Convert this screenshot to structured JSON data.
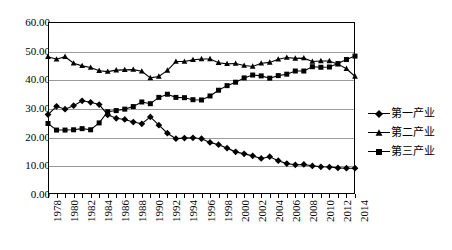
{
  "chart_data": {
    "type": "line",
    "title": "",
    "subtitle": "",
    "xlabel": "",
    "ylabel": "",
    "ylim": [
      0,
      60
    ],
    "ytick_step": 10,
    "ytick_labels": [
      "0.00",
      "10.00",
      "20.00",
      "30.00",
      "40.00",
      "50.00",
      "60.00"
    ],
    "grid": true,
    "legend_position": "right",
    "x": [
      1978,
      1979,
      1980,
      1981,
      1982,
      1983,
      1984,
      1985,
      1986,
      1987,
      1988,
      1989,
      1990,
      1991,
      1992,
      1993,
      1994,
      1995,
      1996,
      1997,
      1998,
      1999,
      2000,
      2001,
      2002,
      2003,
      2004,
      2005,
      2006,
      2007,
      2008,
      2009,
      2010,
      2011,
      2012,
      2013,
      2014
    ],
    "xtick_labels": [
      "1978",
      "1980",
      "1982",
      "1984",
      "1986",
      "1988",
      "1990",
      "1992",
      "1994",
      "1996",
      "1998",
      "2000",
      "2002",
      "2004",
      "2006",
      "2008",
      "2010",
      "2012",
      "2014"
    ],
    "series": [
      {
        "name": "第一产业",
        "marker": "diamond",
        "values": [
          27.7,
          30.6,
          29.6,
          30.8,
          32.5,
          32.0,
          31.2,
          27.6,
          26.4,
          26.0,
          25.1,
          24.5,
          26.9,
          24.0,
          21.2,
          19.3,
          19.5,
          19.6,
          19.3,
          18.0,
          17.2,
          16.0,
          14.7,
          14.0,
          13.3,
          12.4,
          13.0,
          11.6,
          10.6,
          10.2,
          10.3,
          9.8,
          9.5,
          9.4,
          9.1,
          9.0,
          9.0
        ]
      },
      {
        "name": "第二产业",
        "marker": "triangle",
        "values": [
          47.9,
          47.0,
          47.9,
          45.6,
          44.7,
          44.1,
          43.0,
          42.7,
          43.2,
          43.3,
          43.4,
          42.8,
          40.5,
          41.0,
          43.1,
          46.2,
          46.2,
          46.8,
          47.1,
          47.1,
          45.8,
          45.4,
          45.5,
          44.8,
          44.5,
          45.6,
          45.9,
          47.0,
          47.6,
          47.3,
          47.4,
          46.2,
          46.4,
          46.4,
          45.3,
          43.7,
          41.0
        ]
      },
      {
        "name": "第三产业",
        "marker": "square",
        "values": [
          24.6,
          22.3,
          22.3,
          22.4,
          22.8,
          22.4,
          24.8,
          28.7,
          29.1,
          29.6,
          30.5,
          32.1,
          31.5,
          33.7,
          34.8,
          33.7,
          33.6,
          32.9,
          32.8,
          34.2,
          36.2,
          37.8,
          39.0,
          40.5,
          41.5,
          41.2,
          40.4,
          41.3,
          41.8,
          42.9,
          42.9,
          44.4,
          44.2,
          44.3,
          45.5,
          46.9,
          48.1
        ]
      }
    ]
  },
  "legend": {
    "items": [
      {
        "label": "第一产业",
        "marker": "diamond"
      },
      {
        "label": "第二产业",
        "marker": "triangle"
      },
      {
        "label": "第三产业",
        "marker": "square"
      }
    ]
  },
  "colors": {
    "series": "#000000",
    "gridline": "#9a9a9a",
    "frame": "#000000",
    "background": "#ffffff"
  }
}
